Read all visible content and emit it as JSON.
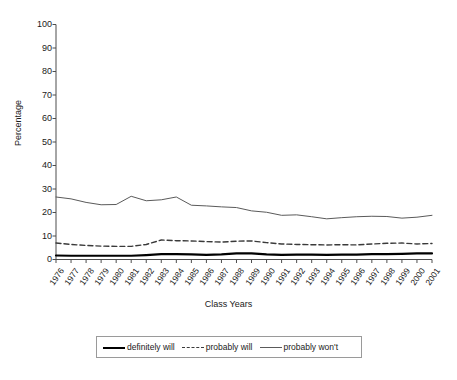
{
  "chart_data": {
    "type": "line",
    "title": "",
    "xlabel": "Class Years",
    "ylabel": "Percentage",
    "ylim": [
      0,
      100
    ],
    "yticks": [
      0,
      10,
      20,
      30,
      40,
      50,
      60,
      70,
      80,
      90,
      100
    ],
    "grid": false,
    "legend_position": "bottom",
    "categories": [
      "1976",
      "1977",
      "1978",
      "1979",
      "1980",
      "1981",
      "1982",
      "1983",
      "1984",
      "1985",
      "1986",
      "1987",
      "1988",
      "1989",
      "1990",
      "1991",
      "1992",
      "1993",
      "1994",
      "1995",
      "1996",
      "1997",
      "1998",
      "1999",
      "2000",
      "2001"
    ],
    "series": [
      {
        "name": "definitely will",
        "style": "solid-thick",
        "color": "#000000",
        "values": [
          1.7,
          1.6,
          1.6,
          1.6,
          1.6,
          1.6,
          1.9,
          2.3,
          2.3,
          2.2,
          2.0,
          2.2,
          2.6,
          2.6,
          2.2,
          2.0,
          2.1,
          2.1,
          2.0,
          2.1,
          2.1,
          2.3,
          2.3,
          2.4,
          2.6,
          2.6
        ]
      },
      {
        "name": "probably will",
        "style": "dashed",
        "color": "#3a3a3a",
        "values": [
          7.0,
          6.4,
          6.0,
          5.7,
          5.6,
          5.6,
          6.4,
          8.3,
          8.0,
          7.9,
          7.6,
          7.4,
          7.8,
          7.9,
          7.2,
          6.6,
          6.4,
          6.3,
          6.2,
          6.3,
          6.2,
          6.6,
          6.9,
          7.0,
          6.6,
          6.8
        ]
      },
      {
        "name": "probably won't",
        "style": "solid-thin",
        "color": "#5a5a5a",
        "values": [
          26.6,
          25.8,
          24.3,
          23.3,
          23.4,
          26.9,
          25.0,
          25.4,
          26.6,
          23.1,
          22.8,
          22.4,
          22.1,
          20.7,
          20.1,
          18.8,
          19.0,
          18.2,
          17.3,
          17.8,
          18.2,
          18.4,
          18.3,
          17.6,
          18.0,
          18.8
        ]
      }
    ]
  },
  "legend": {
    "entries": [
      {
        "label": "definitely will"
      },
      {
        "label": "probably will"
      },
      {
        "label": "probably won't"
      }
    ]
  }
}
